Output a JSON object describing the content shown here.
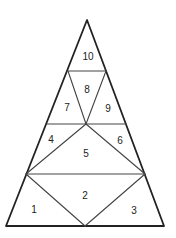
{
  "diagram": {
    "type": "triangle-subdivision",
    "outline": {
      "apex": [
        87,
        20
      ],
      "bottom_left": [
        6,
        226
      ],
      "bottom_right": [
        164,
        226
      ]
    },
    "regions": [
      {
        "id": "1",
        "label": "1",
        "pos": [
          34,
          210
        ]
      },
      {
        "id": "2",
        "label": "2",
        "pos": [
          85,
          196
        ]
      },
      {
        "id": "3",
        "label": "3",
        "pos": [
          134,
          211
        ]
      },
      {
        "id": "4",
        "label": "4",
        "pos": [
          51,
          140
        ]
      },
      {
        "id": "5",
        "label": "5",
        "pos": [
          86,
          154
        ]
      },
      {
        "id": "6",
        "label": "6",
        "pos": [
          120,
          141
        ]
      },
      {
        "id": "7",
        "label": "7",
        "pos": [
          67,
          108
        ]
      },
      {
        "id": "8",
        "label": "8",
        "pos": [
          87,
          90
        ]
      },
      {
        "id": "9",
        "label": "9",
        "pos": [
          108,
          109
        ]
      },
      {
        "id": "10",
        "label": "10",
        "pos": [
          88,
          57
        ]
      }
    ],
    "stroke_color": "#222222",
    "background": "#ffffff"
  }
}
